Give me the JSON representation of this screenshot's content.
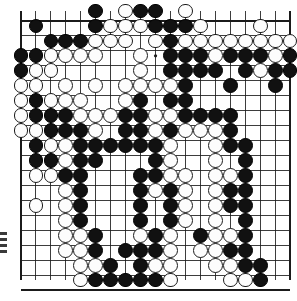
{
  "app": {
    "title": "Go Board Position",
    "description": "19x19 Go game board with black and white stones"
  },
  "board": {
    "size": 19,
    "origin_x": 21,
    "origin_y": 11,
    "spacing": 14.95,
    "stone_radius": 7.4,
    "line_color": "#1b1b1b",
    "background_color": "#ffffff",
    "black_color": "#111111",
    "white_color": "#fdfdfd",
    "white_border_color": "#1a1a1a",
    "star_points": [
      [
        3,
        3
      ],
      [
        9,
        3
      ],
      [
        15,
        3
      ],
      [
        3,
        9
      ],
      [
        9,
        9
      ],
      [
        15,
        9
      ],
      [
        3,
        15
      ],
      [
        9,
        15
      ],
      [
        15,
        15
      ]
    ],
    "stones": [
      {
        "c": 5,
        "r": 0,
        "t": "b"
      },
      {
        "c": 7,
        "r": 0,
        "t": "w"
      },
      {
        "c": 8,
        "r": 0,
        "t": "b"
      },
      {
        "c": 9,
        "r": 0,
        "t": "b"
      },
      {
        "c": 11,
        "r": 0,
        "t": "w"
      },
      {
        "c": 1,
        "r": 1,
        "t": "b"
      },
      {
        "c": 5,
        "r": 1,
        "t": "b"
      },
      {
        "c": 6,
        "r": 1,
        "t": "w"
      },
      {
        "c": 7,
        "r": 1,
        "t": "w"
      },
      {
        "c": 8,
        "r": 1,
        "t": "w"
      },
      {
        "c": 9,
        "r": 1,
        "t": "b"
      },
      {
        "c": 10,
        "r": 1,
        "t": "b"
      },
      {
        "c": 11,
        "r": 1,
        "t": "b"
      },
      {
        "c": 12,
        "r": 1,
        "t": "w"
      },
      {
        "c": 16,
        "r": 1,
        "t": "w"
      },
      {
        "c": 2,
        "r": 2,
        "t": "b"
      },
      {
        "c": 3,
        "r": 2,
        "t": "b"
      },
      {
        "c": 4,
        "r": 2,
        "t": "b"
      },
      {
        "c": 5,
        "r": 2,
        "t": "w"
      },
      {
        "c": 6,
        "r": 2,
        "t": "w"
      },
      {
        "c": 7,
        "r": 2,
        "t": "w"
      },
      {
        "c": 9,
        "r": 2,
        "t": "w"
      },
      {
        "c": 10,
        "r": 2,
        "t": "b"
      },
      {
        "c": 11,
        "r": 2,
        "t": "w"
      },
      {
        "c": 12,
        "r": 2,
        "t": "w"
      },
      {
        "c": 13,
        "r": 2,
        "t": "w"
      },
      {
        "c": 14,
        "r": 2,
        "t": "w"
      },
      {
        "c": 15,
        "r": 2,
        "t": "w"
      },
      {
        "c": 16,
        "r": 2,
        "t": "w"
      },
      {
        "c": 17,
        "r": 2,
        "t": "w"
      },
      {
        "c": 18,
        "r": 2,
        "t": "w"
      },
      {
        "c": 0,
        "r": 3,
        "t": "b"
      },
      {
        "c": 1,
        "r": 3,
        "t": "b"
      },
      {
        "c": 2,
        "r": 3,
        "t": "w"
      },
      {
        "c": 3,
        "r": 3,
        "t": "w"
      },
      {
        "c": 4,
        "r": 3,
        "t": "w"
      },
      {
        "c": 5,
        "r": 3,
        "t": "w"
      },
      {
        "c": 8,
        "r": 3,
        "t": "w"
      },
      {
        "c": 10,
        "r": 3,
        "t": "b"
      },
      {
        "c": 11,
        "r": 3,
        "t": "b"
      },
      {
        "c": 12,
        "r": 3,
        "t": "b"
      },
      {
        "c": 13,
        "r": 3,
        "t": "w"
      },
      {
        "c": 14,
        "r": 3,
        "t": "b"
      },
      {
        "c": 15,
        "r": 3,
        "t": "b"
      },
      {
        "c": 16,
        "r": 3,
        "t": "b"
      },
      {
        "c": 17,
        "r": 3,
        "t": "w"
      },
      {
        "c": 18,
        "r": 3,
        "t": "b"
      },
      {
        "c": 0,
        "r": 4,
        "t": "b"
      },
      {
        "c": 1,
        "r": 4,
        "t": "w"
      },
      {
        "c": 2,
        "r": 4,
        "t": "w"
      },
      {
        "c": 8,
        "r": 4,
        "t": "w"
      },
      {
        "c": 10,
        "r": 4,
        "t": "b"
      },
      {
        "c": 11,
        "r": 4,
        "t": "b"
      },
      {
        "c": 12,
        "r": 4,
        "t": "b"
      },
      {
        "c": 13,
        "r": 4,
        "t": "b"
      },
      {
        "c": 15,
        "r": 4,
        "t": "b"
      },
      {
        "c": 16,
        "r": 4,
        "t": "w"
      },
      {
        "c": 17,
        "r": 4,
        "t": "b"
      },
      {
        "c": 18,
        "r": 4,
        "t": "b"
      },
      {
        "c": 0,
        "r": 5,
        "t": "w"
      },
      {
        "c": 1,
        "r": 5,
        "t": "w"
      },
      {
        "c": 3,
        "r": 5,
        "t": "w"
      },
      {
        "c": 5,
        "r": 5,
        "t": "w"
      },
      {
        "c": 7,
        "r": 5,
        "t": "w"
      },
      {
        "c": 8,
        "r": 5,
        "t": "w"
      },
      {
        "c": 9,
        "r": 5,
        "t": "w"
      },
      {
        "c": 10,
        "r": 5,
        "t": "w"
      },
      {
        "c": 11,
        "r": 5,
        "t": "b"
      },
      {
        "c": 14,
        "r": 5,
        "t": "b"
      },
      {
        "c": 17,
        "r": 5,
        "t": "b"
      },
      {
        "c": 0,
        "r": 6,
        "t": "w"
      },
      {
        "c": 1,
        "r": 6,
        "t": "b"
      },
      {
        "c": 2,
        "r": 6,
        "t": "w"
      },
      {
        "c": 3,
        "r": 6,
        "t": "w"
      },
      {
        "c": 4,
        "r": 6,
        "t": "w"
      },
      {
        "c": 7,
        "r": 6,
        "t": "w"
      },
      {
        "c": 8,
        "r": 6,
        "t": "b"
      },
      {
        "c": 10,
        "r": 6,
        "t": "b"
      },
      {
        "c": 11,
        "r": 6,
        "t": "b"
      },
      {
        "c": 0,
        "r": 7,
        "t": "w"
      },
      {
        "c": 1,
        "r": 7,
        "t": "b"
      },
      {
        "c": 2,
        "r": 7,
        "t": "b"
      },
      {
        "c": 3,
        "r": 7,
        "t": "b"
      },
      {
        "c": 4,
        "r": 7,
        "t": "w"
      },
      {
        "c": 5,
        "r": 7,
        "t": "w"
      },
      {
        "c": 6,
        "r": 7,
        "t": "w"
      },
      {
        "c": 7,
        "r": 7,
        "t": "b"
      },
      {
        "c": 8,
        "r": 7,
        "t": "b"
      },
      {
        "c": 9,
        "r": 7,
        "t": "w"
      },
      {
        "c": 10,
        "r": 7,
        "t": "w"
      },
      {
        "c": 11,
        "r": 7,
        "t": "b"
      },
      {
        "c": 12,
        "r": 7,
        "t": "b"
      },
      {
        "c": 13,
        "r": 7,
        "t": "b"
      },
      {
        "c": 14,
        "r": 7,
        "t": "b"
      },
      {
        "c": 0,
        "r": 8,
        "t": "w"
      },
      {
        "c": 1,
        "r": 8,
        "t": "w"
      },
      {
        "c": 2,
        "r": 8,
        "t": "b"
      },
      {
        "c": 3,
        "r": 8,
        "t": "b"
      },
      {
        "c": 4,
        "r": 8,
        "t": "b"
      },
      {
        "c": 5,
        "r": 8,
        "t": "w"
      },
      {
        "c": 7,
        "r": 8,
        "t": "b"
      },
      {
        "c": 8,
        "r": 8,
        "t": "b"
      },
      {
        "c": 9,
        "r": 8,
        "t": "w"
      },
      {
        "c": 10,
        "r": 8,
        "t": "b"
      },
      {
        "c": 11,
        "r": 8,
        "t": "w"
      },
      {
        "c": 12,
        "r": 8,
        "t": "w"
      },
      {
        "c": 13,
        "r": 8,
        "t": "w"
      },
      {
        "c": 14,
        "r": 8,
        "t": "b"
      },
      {
        "c": 1,
        "r": 9,
        "t": "b"
      },
      {
        "c": 2,
        "r": 9,
        "t": "w"
      },
      {
        "c": 3,
        "r": 9,
        "t": "w"
      },
      {
        "c": 4,
        "r": 9,
        "t": "b"
      },
      {
        "c": 5,
        "r": 9,
        "t": "b"
      },
      {
        "c": 6,
        "r": 9,
        "t": "b"
      },
      {
        "c": 7,
        "r": 9,
        "t": "b"
      },
      {
        "c": 8,
        "r": 9,
        "t": "b"
      },
      {
        "c": 9,
        "r": 9,
        "t": "b"
      },
      {
        "c": 10,
        "r": 9,
        "t": "w"
      },
      {
        "c": 13,
        "r": 9,
        "t": "w"
      },
      {
        "c": 14,
        "r": 9,
        "t": "b"
      },
      {
        "c": 15,
        "r": 9,
        "t": "b"
      },
      {
        "c": 1,
        "r": 10,
        "t": "b"
      },
      {
        "c": 2,
        "r": 10,
        "t": "b"
      },
      {
        "c": 3,
        "r": 10,
        "t": "w"
      },
      {
        "c": 4,
        "r": 10,
        "t": "b"
      },
      {
        "c": 5,
        "r": 10,
        "t": "b"
      },
      {
        "c": 9,
        "r": 10,
        "t": "b"
      },
      {
        "c": 10,
        "r": 10,
        "t": "w"
      },
      {
        "c": 13,
        "r": 10,
        "t": "w"
      },
      {
        "c": 15,
        "r": 10,
        "t": "b"
      },
      {
        "c": 1,
        "r": 11,
        "t": "w"
      },
      {
        "c": 2,
        "r": 11,
        "t": "w"
      },
      {
        "c": 3,
        "r": 11,
        "t": "b"
      },
      {
        "c": 4,
        "r": 11,
        "t": "b"
      },
      {
        "c": 8,
        "r": 11,
        "t": "b"
      },
      {
        "c": 9,
        "r": 11,
        "t": "b"
      },
      {
        "c": 10,
        "r": 11,
        "t": "w"
      },
      {
        "c": 11,
        "r": 11,
        "t": "w"
      },
      {
        "c": 13,
        "r": 11,
        "t": "w"
      },
      {
        "c": 14,
        "r": 11,
        "t": "w"
      },
      {
        "c": 15,
        "r": 11,
        "t": "b"
      },
      {
        "c": 3,
        "r": 12,
        "t": "w"
      },
      {
        "c": 4,
        "r": 12,
        "t": "b"
      },
      {
        "c": 8,
        "r": 12,
        "t": "b"
      },
      {
        "c": 9,
        "r": 12,
        "t": "w"
      },
      {
        "c": 10,
        "r": 12,
        "t": "b"
      },
      {
        "c": 11,
        "r": 12,
        "t": "w"
      },
      {
        "c": 13,
        "r": 12,
        "t": "w"
      },
      {
        "c": 14,
        "r": 12,
        "t": "b"
      },
      {
        "c": 15,
        "r": 12,
        "t": "b"
      },
      {
        "c": 1,
        "r": 13,
        "t": "w"
      },
      {
        "c": 3,
        "r": 13,
        "t": "w"
      },
      {
        "c": 4,
        "r": 13,
        "t": "b"
      },
      {
        "c": 8,
        "r": 13,
        "t": "b"
      },
      {
        "c": 10,
        "r": 13,
        "t": "b"
      },
      {
        "c": 11,
        "r": 13,
        "t": "w"
      },
      {
        "c": 13,
        "r": 13,
        "t": "w"
      },
      {
        "c": 14,
        "r": 13,
        "t": "b"
      },
      {
        "c": 15,
        "r": 13,
        "t": "b"
      },
      {
        "c": 3,
        "r": 14,
        "t": "w"
      },
      {
        "c": 4,
        "r": 14,
        "t": "b"
      },
      {
        "c": 8,
        "r": 14,
        "t": "b"
      },
      {
        "c": 10,
        "r": 14,
        "t": "b"
      },
      {
        "c": 11,
        "r": 14,
        "t": "w"
      },
      {
        "c": 13,
        "r": 14,
        "t": "w"
      },
      {
        "c": 15,
        "r": 14,
        "t": "b"
      },
      {
        "c": 3,
        "r": 15,
        "t": "w"
      },
      {
        "c": 4,
        "r": 15,
        "t": "w"
      },
      {
        "c": 5,
        "r": 15,
        "t": "b"
      },
      {
        "c": 8,
        "r": 15,
        "t": "w"
      },
      {
        "c": 9,
        "r": 15,
        "t": "b"
      },
      {
        "c": 10,
        "r": 15,
        "t": "w"
      },
      {
        "c": 12,
        "r": 15,
        "t": "b"
      },
      {
        "c": 13,
        "r": 15,
        "t": "w"
      },
      {
        "c": 14,
        "r": 15,
        "t": "w"
      },
      {
        "c": 15,
        "r": 15,
        "t": "b"
      },
      {
        "c": 3,
        "r": 16,
        "t": "w"
      },
      {
        "c": 4,
        "r": 16,
        "t": "w"
      },
      {
        "c": 5,
        "r": 16,
        "t": "b"
      },
      {
        "c": 7,
        "r": 16,
        "t": "b"
      },
      {
        "c": 8,
        "r": 16,
        "t": "b"
      },
      {
        "c": 9,
        "r": 16,
        "t": "b"
      },
      {
        "c": 10,
        "r": 16,
        "t": "w"
      },
      {
        "c": 12,
        "r": 16,
        "t": "w"
      },
      {
        "c": 13,
        "r": 16,
        "t": "w"
      },
      {
        "c": 14,
        "r": 16,
        "t": "b"
      },
      {
        "c": 15,
        "r": 16,
        "t": "b"
      },
      {
        "c": 4,
        "r": 17,
        "t": "w"
      },
      {
        "c": 5,
        "r": 17,
        "t": "w"
      },
      {
        "c": 6,
        "r": 17,
        "t": "b"
      },
      {
        "c": 8,
        "r": 17,
        "t": "b"
      },
      {
        "c": 9,
        "r": 17,
        "t": "w"
      },
      {
        "c": 10,
        "r": 17,
        "t": "w"
      },
      {
        "c": 13,
        "r": 17,
        "t": "w"
      },
      {
        "c": 14,
        "r": 17,
        "t": "w"
      },
      {
        "c": 15,
        "r": 17,
        "t": "b"
      },
      {
        "c": 16,
        "r": 17,
        "t": "b"
      },
      {
        "c": 4,
        "r": 18,
        "t": "w"
      },
      {
        "c": 5,
        "r": 18,
        "t": "b"
      },
      {
        "c": 6,
        "r": 18,
        "t": "b"
      },
      {
        "c": 7,
        "r": 18,
        "t": "b"
      },
      {
        "c": 8,
        "r": 18,
        "t": "b"
      },
      {
        "c": 9,
        "r": 18,
        "t": "b"
      },
      {
        "c": 10,
        "r": 18,
        "t": "w"
      },
      {
        "c": 14,
        "r": 18,
        "t": "w"
      },
      {
        "c": 15,
        "r": 18,
        "t": "w"
      },
      {
        "c": 16,
        "r": 18,
        "t": "b"
      }
    ]
  },
  "artifacts": {
    "edge_mark_count": 4
  }
}
